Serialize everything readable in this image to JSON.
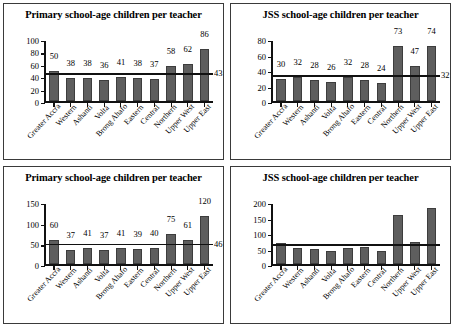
{
  "figure": {
    "panel_count": 4,
    "categories": [
      "Greater Accra",
      "Western",
      "Ashanti",
      "Volta",
      "Brong Ahafo",
      "Eastern",
      "Central",
      "Northern",
      "Upper West",
      "Upper East"
    ]
  },
  "chart_data": [
    {
      "type": "bar",
      "panel": "top-left",
      "title": "Primary school-age children per teacher",
      "categories": [
        "Greater Accra",
        "Western",
        "Ashanti",
        "Volta",
        "Brong Ahafo",
        "Eastern",
        "Central",
        "Northern",
        "Upper West",
        "Upper East"
      ],
      "values": [
        50,
        38,
        38,
        36,
        41,
        38,
        37,
        58,
        62,
        86
      ],
      "data_labels": [
        "50",
        "38",
        "38",
        "36",
        "41",
        "38",
        "37",
        "58",
        "62",
        "86"
      ],
      "reference_line": 43,
      "reference_label": "43",
      "xlabel": "",
      "ylabel": "",
      "ylim": [
        0,
        100
      ],
      "yticks": [
        0,
        20,
        40,
        60,
        80,
        100
      ],
      "ytick_labels": [
        "0",
        "20",
        "40",
        "60",
        "80",
        "100"
      ],
      "grid": false,
      "legend": "none"
    },
    {
      "type": "bar",
      "panel": "top-right",
      "title": "JSS school-age children per teacher",
      "categories": [
        "Greater Accra",
        "Western",
        "Ashanti",
        "Volta",
        "Brong Ahafo",
        "Eastern",
        "Central",
        "Northern",
        "Upper West",
        "Upper East"
      ],
      "values": [
        30,
        32,
        28,
        26,
        32,
        28,
        24,
        73,
        47,
        74
      ],
      "data_labels": [
        "30",
        "32",
        "28",
        "26",
        "32",
        "28",
        "24",
        "73",
        "47",
        "74"
      ],
      "reference_line": 32,
      "reference_label": "32",
      "xlabel": "",
      "ylabel": "",
      "ylim": [
        0,
        80
      ],
      "yticks": [
        0,
        20,
        40,
        60,
        80
      ],
      "ytick_labels": [
        "0",
        "20",
        "40",
        "60",
        "80"
      ],
      "grid": false,
      "legend": "none"
    },
    {
      "type": "bar",
      "panel": "bottom-left",
      "title": "Primary school-age children per teacher",
      "categories": [
        "Greater Accra",
        "Western",
        "Ashanti",
        "Volta",
        "Brong Ahafo",
        "Eastern",
        "Central",
        "Northern",
        "Upper West",
        "Upper East"
      ],
      "values": [
        60,
        37,
        41,
        37,
        41,
        39,
        40,
        75,
        61,
        120
      ],
      "data_labels": [
        "60",
        "37",
        "41",
        "37",
        "41",
        "39",
        "40",
        "75",
        "61",
        "120"
      ],
      "reference_line": 46,
      "reference_label": "46",
      "xlabel": "",
      "ylabel": "",
      "ylim": [
        0,
        150
      ],
      "yticks": [
        0,
        50,
        100,
        150
      ],
      "ytick_labels": [
        "0",
        "50",
        "100",
        "150"
      ],
      "grid": false,
      "legend": "none"
    },
    {
      "type": "bar",
      "panel": "bottom-right",
      "title": "JSS school-age children per teacher",
      "categories": [
        "Greater Accra",
        "Western",
        "Ashanti",
        "Volta",
        "Brong Ahafo",
        "Eastern",
        "Central",
        "Northern",
        "Upper West",
        "Upper East"
      ],
      "values": [
        72,
        55,
        50,
        45,
        55,
        57,
        45,
        162,
        74,
        188
      ],
      "data_labels": [
        "",
        "",
        "",
        "",
        "",
        "",
        "",
        "",
        "",
        ""
      ],
      "reference_line": 60,
      "reference_label": "",
      "xlabel": "",
      "ylabel": "",
      "ylim": [
        0,
        200
      ],
      "yticks": [
        0,
        50,
        100,
        150,
        200
      ],
      "ytick_labels": [
        "0",
        "50",
        "100",
        "150",
        "200"
      ],
      "grid": false,
      "legend": "none"
    }
  ],
  "colors": {
    "bar_fill": "#5e5e5e",
    "bar_stroke": "#3d3d3d",
    "axis": "#111111",
    "panel_border": "#3a3a3a",
    "background": "#ffffff"
  }
}
